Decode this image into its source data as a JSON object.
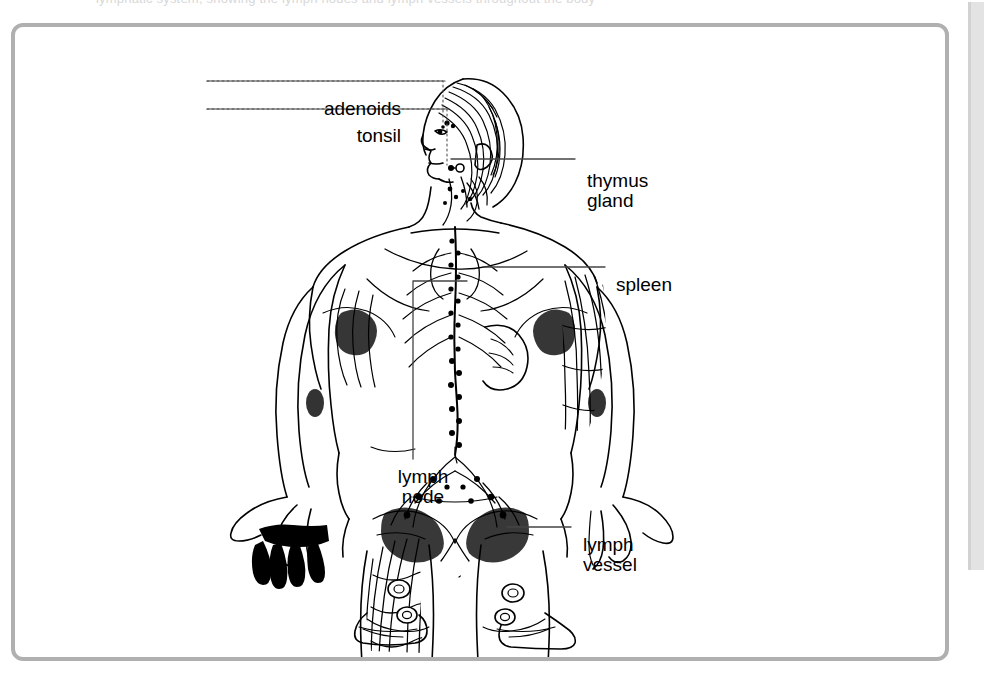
{
  "page": {
    "background_color": "#ffffff",
    "clipped_top_text": "lymphatic system, showing the lymph nodes and lymph vessels throughout the body",
    "right_margin_panel_color": "#e3e3e3"
  },
  "figure": {
    "name": "lymphatic-system-diagram",
    "border_color": "#b0b0b0",
    "ink_color": "#000000",
    "labels": [
      {
        "id": "adenoids",
        "text": "adenoids",
        "align": "right",
        "leader": "horizontal-dotted-line-to-nasopharynx"
      },
      {
        "id": "tonsil",
        "text": "tonsil",
        "align": "right",
        "leader": "horizontal-dotted-line-to-throat"
      },
      {
        "id": "thymus-gland",
        "text": "thymus\ngland",
        "align": "left",
        "leader": "horizontal-line-to-upper-chest"
      },
      {
        "id": "spleen",
        "text": "spleen",
        "align": "left",
        "leader": "horizontal-line-to-left-upper-abdomen"
      },
      {
        "id": "lymph-node",
        "text": "lymph\nnode",
        "align": "center",
        "leader": "elbow-line-up-then-right-to-groin-node"
      },
      {
        "id": "lymph-vessel",
        "text": "lymph\nvessel",
        "align": "left",
        "leader": "horizontal-line-to-lower-leg-vessel"
      }
    ]
  }
}
